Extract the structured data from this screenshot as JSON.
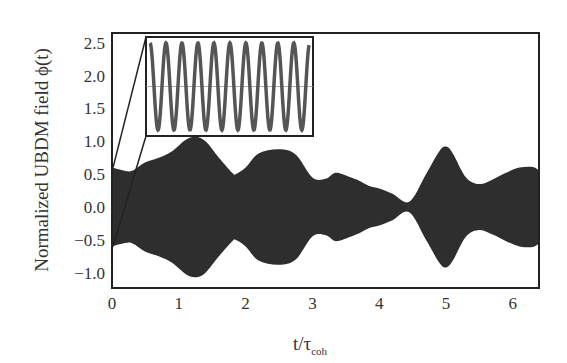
{
  "chart_data": {
    "type": "area",
    "title": "",
    "xlabel": "t/τcoh",
    "xlabel_main": "t/τ",
    "xlabel_sub": "coh",
    "ylabel": "Normalized UBDM field ϕ(t)",
    "xlim": [
      0,
      6.4
    ],
    "ylim": [
      -1.15,
      2.7
    ],
    "xticks": [
      0,
      1,
      2,
      3,
      4,
      5,
      6
    ],
    "xtick_labels": [
      "0",
      "1",
      "2",
      "3",
      "4",
      "5",
      "6"
    ],
    "yticks": [
      -1.0,
      -0.5,
      0.0,
      0.5,
      1.0,
      1.5,
      2.0,
      2.5
    ],
    "ytick_labels": [
      "−1.0",
      "−0.5",
      "0.0",
      "0.5",
      "1.0",
      "1.5",
      "2.0",
      "2.5"
    ],
    "grid": false,
    "legend": null,
    "series": [
      {
        "name": "envelope (filled rapid oscillation)",
        "color": "#2e2e2e",
        "t": [
          0.0,
          0.15,
          0.3,
          0.5,
          0.7,
          0.9,
          1.1,
          1.25,
          1.4,
          1.6,
          1.8,
          1.85,
          2.0,
          2.2,
          2.5,
          2.75,
          3.0,
          3.2,
          3.35,
          3.55,
          3.7,
          3.85,
          4.0,
          4.2,
          4.45,
          4.7,
          4.9,
          5.0,
          5.1,
          5.3,
          5.5,
          5.7,
          5.9,
          6.1,
          6.3,
          6.4
        ],
        "amplitude": [
          0.6,
          0.56,
          0.55,
          0.68,
          0.75,
          0.85,
          1.02,
          1.07,
          1.0,
          0.75,
          0.52,
          0.5,
          0.6,
          0.82,
          0.88,
          0.8,
          0.45,
          0.43,
          0.52,
          0.46,
          0.4,
          0.32,
          0.28,
          0.2,
          0.08,
          0.5,
          0.85,
          0.92,
          0.82,
          0.45,
          0.35,
          0.42,
          0.52,
          0.6,
          0.61,
          0.55
        ]
      }
    ],
    "inset": {
      "description": "zoom of early time showing sinusoidal oscillation",
      "cycles": 10,
      "color": "#555555",
      "zoom_from": {
        "t": 0.0,
        "y_top": 0.6,
        "y_bottom": -0.6
      }
    }
  }
}
